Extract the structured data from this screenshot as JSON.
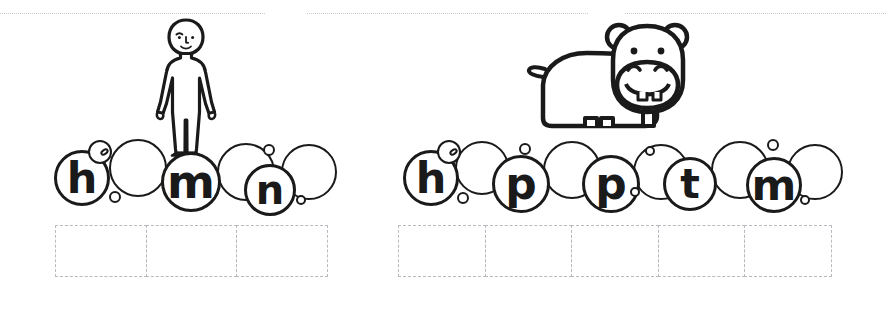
{
  "page": {
    "background_color": "#ffffff",
    "ink_color": "#1a1a1a",
    "dash_color": "#b9b9bf",
    "rule_color": "#c9c9cf",
    "width": 886,
    "height": 310
  },
  "top_rules": [
    {
      "name": "top-rule-left",
      "x": 0,
      "y": 13,
      "width": 265
    },
    {
      "name": "top-rule-middle",
      "x": 307,
      "y": 13,
      "width": 281
    },
    {
      "name": "top-rule-right",
      "x": 625,
      "y": 13,
      "width": 261
    }
  ],
  "exercises": [
    {
      "id": "exercise-human",
      "picture": {
        "name": "human-figure-illustration",
        "label": "human",
        "x": 148,
        "y": 16,
        "width": 76,
        "height": 140
      },
      "bubbles": [
        {
          "letter": "h",
          "cx": 82,
          "cy": 178,
          "r": 28
        },
        {
          "letter": "",
          "cx": 138,
          "cy": 168,
          "r": 29
        },
        {
          "letter": "m",
          "cx": 191,
          "cy": 182,
          "r": 30
        },
        {
          "letter": "",
          "cx": 246,
          "cy": 172,
          "r": 29
        },
        {
          "letter": "n",
          "cx": 270,
          "cy": 190,
          "r": 26
        },
        {
          "letter": "",
          "cx": 309,
          "cy": 172,
          "r": 28
        }
      ],
      "dot_bubbles": [
        {
          "cx": 115,
          "cy": 197,
          "r": 6
        },
        {
          "cx": 269,
          "cy": 150,
          "r": 6
        },
        {
          "cx": 301,
          "cy": 200,
          "r": 5
        }
      ],
      "highlight": {
        "cx": 100,
        "cy": 152,
        "r": 12,
        "glint_w": 9,
        "glint_h": 6
      },
      "answer_boxes": {
        "x": 55,
        "y": 225,
        "width": 275,
        "height": 52,
        "count": 3
      }
    },
    {
      "id": "exercise-hippo",
      "picture": {
        "name": "hippo-illustration",
        "label": "hippopotamus",
        "x": 527,
        "y": 22,
        "width": 172,
        "height": 124
      },
      "bubbles": [
        {
          "letter": "h",
          "cx": 431,
          "cy": 178,
          "r": 28
        },
        {
          "letter": "",
          "cx": 482,
          "cy": 168,
          "r": 27
        },
        {
          "letter": "p",
          "cx": 521,
          "cy": 184,
          "r": 29
        },
        {
          "letter": "",
          "cx": 572,
          "cy": 170,
          "r": 29
        },
        {
          "letter": "p",
          "cx": 611,
          "cy": 184,
          "r": 29
        },
        {
          "letter": "",
          "cx": 661,
          "cy": 172,
          "r": 28
        },
        {
          "letter": "t",
          "cx": 690,
          "cy": 184,
          "r": 27
        },
        {
          "letter": "",
          "cx": 740,
          "cy": 170,
          "r": 29
        },
        {
          "letter": "m",
          "cx": 774,
          "cy": 185,
          "r": 28
        },
        {
          "letter": "",
          "cx": 815,
          "cy": 172,
          "r": 28
        }
      ],
      "dot_bubbles": [
        {
          "cx": 463,
          "cy": 198,
          "r": 6
        },
        {
          "cx": 525,
          "cy": 149,
          "r": 6
        },
        {
          "cx": 635,
          "cy": 192,
          "r": 5
        },
        {
          "cx": 650,
          "cy": 151,
          "r": 5
        },
        {
          "cx": 773,
          "cy": 145,
          "r": 6
        },
        {
          "cx": 805,
          "cy": 200,
          "r": 5
        }
      ],
      "highlight": {
        "cx": 449,
        "cy": 152,
        "r": 12,
        "glint_w": 9,
        "glint_h": 6
      },
      "answer_boxes": {
        "x": 398,
        "y": 225,
        "width": 438,
        "height": 52,
        "count": 5
      }
    }
  ]
}
